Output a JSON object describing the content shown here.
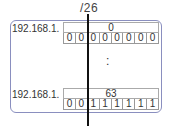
{
  "prefix_label": "/26",
  "ellipsis": ":",
  "rows": [
    {
      "label": "192.168.1.",
      "decimal": "0",
      "bits": [
        "0",
        "0",
        "0",
        "0",
        "0",
        "0",
        "0",
        "0"
      ]
    },
    {
      "label": "192.168.1.",
      "decimal": "63",
      "bits": [
        "0",
        "0",
        "1",
        "1",
        "1",
        "1",
        "1",
        "1"
      ]
    }
  ],
  "colors": {
    "box_border": "#8a8fbf",
    "divider": "#111111"
  }
}
